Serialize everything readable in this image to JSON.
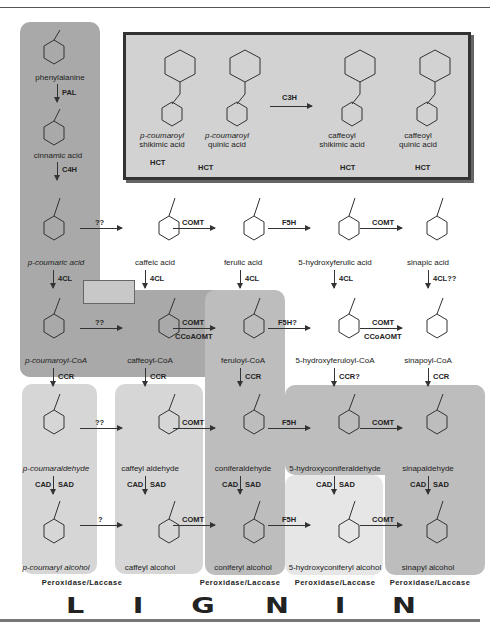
{
  "diagram": {
    "inset": {
      "compounds": [
        {
          "name": "p-coumaroyl shikimic acid",
          "line1": "p-coumaroyl",
          "line2": "shikimic acid"
        },
        {
          "name": "p-coumaroyl quinic acid",
          "line1": "p-coumaroyl",
          "line2": "quinic acid"
        },
        {
          "name": "caffeoyl shikimic acid",
          "line1": "caffeoyl",
          "line2": "shikimic acid"
        },
        {
          "name": "caffeoyl quinic acid",
          "line1": "caffeoyl",
          "line2": "quinic acid"
        }
      ],
      "enzymes": {
        "c3h": "C3H",
        "hct": "HCT"
      }
    },
    "top_column": {
      "compounds": [
        "phenylalanine",
        "cinnamic acid"
      ],
      "enzymes": [
        "PAL",
        "C4H"
      ]
    },
    "rows": {
      "acids": [
        "p-coumaric acid",
        "caffeic acid",
        "ferulic acid",
        "5-hydroxyferulic acid",
        "sinapic acid"
      ],
      "acid_enzymes": [
        "??",
        "COMT",
        "F5H",
        "COMT"
      ],
      "acid_to_coa": [
        "4CL",
        "4CL",
        "4CL",
        "4CL",
        "4CL??"
      ],
      "coas": [
        "p-coumaroyl-CoA",
        "caffeoyl-CoA",
        "feruloyl-CoA",
        "5-hydroxyferuloyl-CoA",
        "sinapoyl-CoA"
      ],
      "coa_enzymes": [
        "??",
        "COMT / CCoAOMT",
        "F5H?",
        "COMT / CCoAOMT"
      ],
      "coa_enzymes_split": [
        [
          "??"
        ],
        [
          "COMT",
          "CCoAOMT"
        ],
        [
          "F5H?"
        ],
        [
          "COMT",
          "CCoAOMT"
        ]
      ],
      "coa_to_ald": [
        "CCR",
        "CCR",
        "CCR",
        "CCR?",
        "CCR"
      ],
      "aldehydes": [
        "p-coumaraldehyde",
        "caffeyl aldehyde",
        "coniferaldehyde",
        "5-hydroxyconiferaldehyde",
        "sinapaldehyde"
      ],
      "ald_enzymes": [
        "??",
        "COMT",
        "F5H",
        "COMT"
      ],
      "ald_to_alc": [
        "CAD",
        "SAD"
      ],
      "alcohols": [
        "p-coumaryl alcohol",
        "caffeyl alcohol",
        "coniferyl alcohol",
        "5-hydroxyconiferyl alcohol",
        "sinapyl alcohol"
      ],
      "alc_enzymes": [
        "?",
        "COMT",
        "F5H",
        "COMT"
      ]
    },
    "polymerization": {
      "enzyme": "Peroxidase/Laccase",
      "letters": [
        "L",
        "I",
        "G",
        "N",
        "I",
        "N"
      ]
    },
    "substituents": {
      "oh": "OH",
      "ome": "OMe",
      "meo": "MeO",
      "ho": "HO",
      "coa": "CoA",
      "s": "S",
      "nh2": "NH2",
      "h": "H",
      "o": "O"
    },
    "colors": {
      "dark": "#a9a9a9",
      "mid": "#bdbdbd",
      "light": "#d6d6d6",
      "lighter": "#e6e6e6",
      "ink": "#222222"
    }
  }
}
